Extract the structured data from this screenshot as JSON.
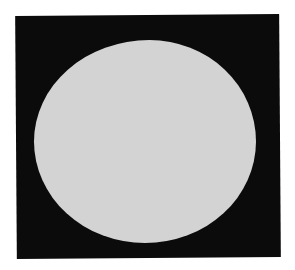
{
  "image": {
    "description": "Light gray disc on a black square background, white margin",
    "colors": {
      "background": "#ffffff",
      "square": "#0b0b0b",
      "disc": "#d3d3d3"
    }
  }
}
